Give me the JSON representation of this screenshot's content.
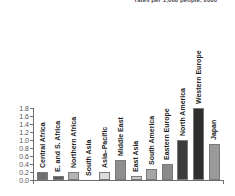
{
  "chart_data": {
    "type": "bar",
    "title": "rates per 1,000 people, 2000",
    "xlabel": "",
    "ylabel": "",
    "ylim": [
      0.0,
      1.8
    ],
    "grid": false,
    "legend": "none",
    "orientation": "vertical",
    "categories": [
      "Central Africa",
      "E. and S. Africa",
      "Northern Africa",
      "South Asia",
      "Asia–Pacific",
      "Middle East",
      "East Asia",
      "South America",
      "Eastern Europe",
      "North America",
      "Western Europe",
      "Japan"
    ],
    "values": [
      0.2,
      0.1,
      0.19,
      0.0,
      0.19,
      0.49,
      0.1,
      0.28,
      0.39,
      1.0,
      1.79,
      0.89
    ],
    "bar_colors": [
      "#6f6f6f",
      "#5a5a5a",
      "#b4b4b4",
      "#e8e8e8",
      "#dcdcdc",
      "#8e8e8e",
      "#c9c9c9",
      "#a6a6a6",
      "#8a8a8a",
      "#3c3c3c",
      "#2e2e2e",
      "#9a9a9a"
    ],
    "ytick_labels": [
      "0.0",
      "0.2",
      "0.4",
      "0.6",
      "0.8",
      "1.0",
      "1.2",
      "1.4",
      "1.6",
      "1.8"
    ],
    "ytick_values": [
      0.0,
      0.2,
      0.4,
      0.6,
      0.8,
      1.0,
      1.2,
      1.4,
      1.6,
      1.8
    ],
    "axis_color": "#6e6e6e",
    "title_color": "#4a4a4a"
  }
}
